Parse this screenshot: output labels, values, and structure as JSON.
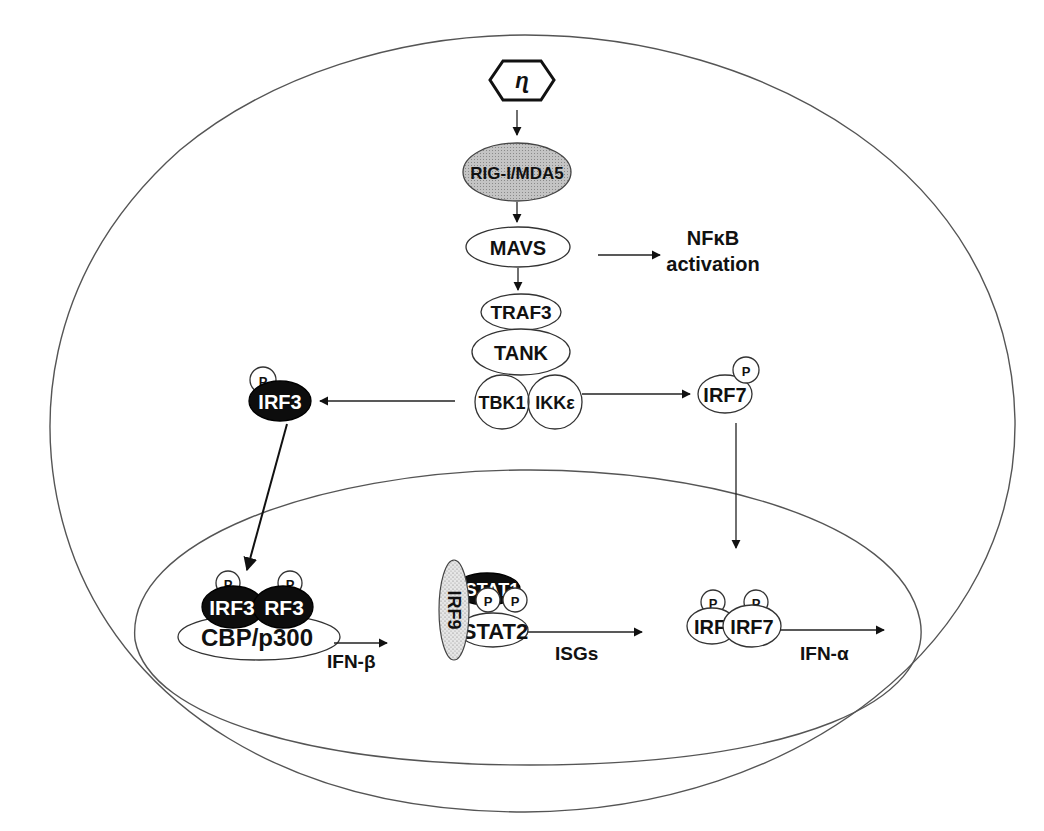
{
  "diagram": {
    "type": "signaling-pathway",
    "compartments": {
      "cell": "cell membrane (outer ellipse)",
      "nucleus": "nucleus (inner ellipse)"
    },
    "virus": {
      "icon": "hexagon-virus-rna-icon",
      "glyph": "ɳ"
    },
    "nodes": {
      "rig_mda5": "RIG-I/MDA5",
      "mavs": "MAVS",
      "nfkb_line1": "NFκB",
      "nfkb_line2": "activation",
      "traf3": "TRAF3",
      "tank": "TANK",
      "tbk1": "TBK1",
      "ikke": "IKKε",
      "irf3_cyto": "IRF3",
      "irf7_cyto": "IRF7",
      "phospho": "P",
      "irf3_dimer_left": "IRF3",
      "irf3_dimer_right": "RF3",
      "cbp_p300": "CBP/p300",
      "ifn_beta": "IFN-β",
      "irf9": "IRF9",
      "stat1": "STAT1",
      "stat2": "STAT2",
      "isgs": "ISGs",
      "irf7_dimer_left": "IRF",
      "irf7_dimer_right": "IRF7",
      "ifn_alpha": "IFN-α"
    },
    "edges": [
      {
        "from": "virus",
        "to": "RIG-I/MDA5"
      },
      {
        "from": "RIG-I/MDA5",
        "to": "MAVS"
      },
      {
        "from": "MAVS",
        "to": "NFκB activation"
      },
      {
        "from": "MAVS",
        "to": "TRAF3"
      },
      {
        "from": "TBK1/IKKε",
        "to": "IRF3 (P)"
      },
      {
        "from": "TBK1/IKKε",
        "to": "IRF7 (P)"
      },
      {
        "from": "IRF3 (P)",
        "to": "IRF3 dimer + CBP/p300 (nucleus)"
      },
      {
        "from": "IRF7 (P)",
        "to": "IRF7 dimer (nucleus)"
      },
      {
        "from": "IRF3 dimer + CBP/p300",
        "to": "IFN-β"
      },
      {
        "from": "ISGF3 (IRF9/STAT1/STAT2)",
        "to": "ISGs"
      },
      {
        "from": "IRF7 dimer",
        "to": "IFN-α"
      }
    ],
    "colors": {
      "line": "#333333",
      "dark_node": "#0d0d0d",
      "shaded_node": "#bdbdbd",
      "stipple_node": "#d8d8d8"
    }
  }
}
